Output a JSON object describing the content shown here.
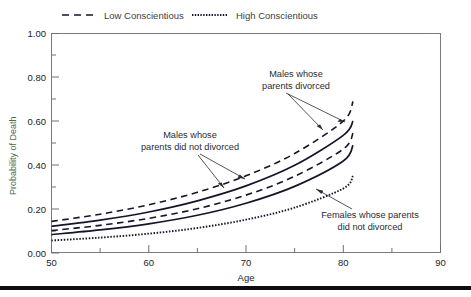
{
  "legend": {
    "position": "top",
    "entries": [
      {
        "label": "Low Conscientious",
        "style": "dashed"
      },
      {
        "label": "High Conscientious",
        "style": "dotted"
      }
    ]
  },
  "axes": {
    "y_title": "Probability of Death",
    "x_title": "Age",
    "y_ticks": [
      "0.00",
      "0.20",
      "0.40",
      "0.60",
      "0.80",
      "1.00"
    ],
    "x_ticks": [
      "50",
      "60",
      "70",
      "80",
      "90"
    ],
    "y_minor_count": 1,
    "x_minor_count": 1
  },
  "annotations": [
    {
      "id": "males-divorced",
      "line1": "Males whose",
      "line2": "parents divorced"
    },
    {
      "id": "males-not-divorced",
      "line1": "Males whose",
      "line2": "parents did not divorced"
    },
    {
      "id": "females-not-divorced",
      "line1": "Females whose parents",
      "line2": "did not divorced"
    }
  ],
  "chart_data": {
    "type": "line",
    "title": "",
    "xlabel": "Age",
    "ylabel": "Probability of Death",
    "xlim": [
      50,
      90
    ],
    "ylim": [
      0.0,
      1.0
    ],
    "xticks": [
      50,
      60,
      70,
      80,
      90
    ],
    "yticks": [
      0.0,
      0.2,
      0.4,
      0.6,
      0.8,
      1.0
    ],
    "grid": false,
    "legend_position": "top",
    "x": [
      50,
      55,
      60,
      65,
      70,
      75,
      80,
      81
    ],
    "series": [
      {
        "name": "Males whose parents divorced - Low Conscientious",
        "style": "dashed",
        "group": "males-divorced",
        "conscientiousness": "Low Conscientious",
        "values": [
          0.142,
          0.175,
          0.218,
          0.275,
          0.35,
          0.452,
          0.6,
          0.69
        ]
      },
      {
        "name": "Males whose parents divorced - High Conscientious",
        "style": "solid",
        "group": "males-divorced",
        "conscientiousness": "High Conscientious",
        "values": [
          0.12,
          0.148,
          0.185,
          0.236,
          0.304,
          0.398,
          0.535,
          0.6
        ]
      },
      {
        "name": "Males whose parents did not divorced - Low Conscientious",
        "style": "dashed",
        "group": "males-not-divorced",
        "conscientiousness": "Low Conscientious",
        "values": [
          0.1,
          0.124,
          0.156,
          0.2,
          0.262,
          0.348,
          0.472,
          0.545
        ]
      },
      {
        "name": "Males whose parents did not divorced - High Conscientious",
        "style": "solid",
        "group": "males-not-divorced",
        "conscientiousness": "High Conscientious",
        "values": [
          0.082,
          0.103,
          0.131,
          0.17,
          0.225,
          0.302,
          0.418,
          0.49
        ]
      },
      {
        "name": "Females whose parents did not divorced - High Conscientious",
        "style": "dotted",
        "group": "females-not-divorced",
        "conscientiousness": "High Conscientious",
        "values": [
          0.055,
          0.068,
          0.086,
          0.112,
          0.15,
          0.205,
          0.292,
          0.35
        ]
      }
    ]
  }
}
